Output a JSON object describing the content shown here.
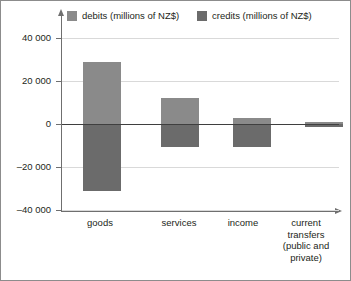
{
  "legend": {
    "entries": [
      {
        "label": "debits (millions of NZ$)",
        "color": "#8a8a8a",
        "key": "debits"
      },
      {
        "label": "credits (millions of NZ$)",
        "color": "#6b6b6b",
        "key": "credits"
      }
    ]
  },
  "axis": {
    "y_ticks": [
      "40 000",
      "20 000",
      "0",
      "–20 000",
      "–40 000"
    ],
    "y_tick_values": [
      40000,
      20000,
      0,
      -20000,
      -40000
    ]
  },
  "chart_data": {
    "type": "bar",
    "title": "",
    "subtitle": "",
    "xlabel": "",
    "ylabel": "",
    "ylim": [
      -40000,
      40000
    ],
    "grid": true,
    "legend_position": "top",
    "stacked_about_zero": true,
    "categories": [
      "goods",
      "services",
      "income",
      "current\ntransfers\n(public and\nprivate)"
    ],
    "category_labels_flat": [
      "goods",
      "services",
      "income",
      "current transfers (public and private)"
    ],
    "series": [
      {
        "name": "debits (millions of NZ$)",
        "color": "#8a8a8a",
        "values": [
          29000,
          12000,
          2800,
          1000
        ]
      },
      {
        "name": "credits (millions of NZ$)",
        "color": "#6b6b6b",
        "values": [
          -31000,
          -10500,
          -10500,
          -1200
        ]
      }
    ],
    "yticklabels": [
      "40 000",
      "20 000",
      "0",
      "–20 000",
      "–40 000"
    ],
    "ytick_values": [
      40000,
      20000,
      0,
      -20000,
      -40000
    ]
  }
}
